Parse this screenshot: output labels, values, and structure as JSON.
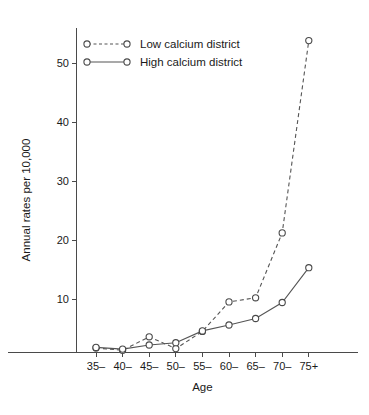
{
  "chart_data": {
    "type": "line",
    "title": "",
    "xlabel": "Age",
    "ylabel": "Annual rates per 10,000",
    "categories": [
      "35–",
      "40–",
      "45–",
      "50–",
      "55–",
      "60–",
      "65–",
      "70–",
      "75+"
    ],
    "yticks": [
      10,
      20,
      30,
      40,
      50
    ],
    "ylim": [
      0,
      56
    ],
    "grid": false,
    "legend_position": "top-left",
    "series": [
      {
        "name": "Low calcium district",
        "style": "dashed",
        "marker": "open-circle",
        "color": "#555555",
        "values": [
          1.7,
          1.3,
          3.6,
          1.6,
          4.5,
          9.5,
          10.2,
          21.2,
          53.8
        ]
      },
      {
        "name": "High calcium district",
        "style": "solid",
        "marker": "open-circle",
        "color": "#555555",
        "values": [
          1.8,
          1.5,
          2.2,
          2.6,
          4.6,
          5.6,
          6.7,
          9.4,
          15.3
        ]
      }
    ]
  },
  "legend": {
    "items": [
      {
        "label": "Low calcium district"
      },
      {
        "label": "High calcium district"
      }
    ]
  },
  "axes": {
    "y_title": "Annual rates per 10,000",
    "x_title": "Age"
  }
}
